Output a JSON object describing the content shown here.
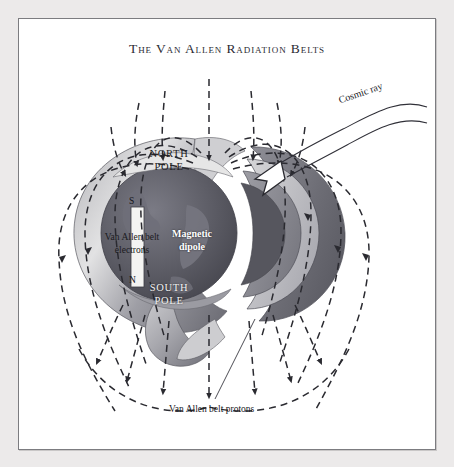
{
  "figure": {
    "title": "The Van Allen Radiation Belts",
    "type": "scientific-diagram"
  },
  "labels": {
    "north_pole_line1": "NORTH",
    "north_pole_line2": "POLE",
    "south_pole_line1": "SOUTH",
    "south_pole_line2": "POLE",
    "electrons_line1": "Van Allen belt",
    "electrons_line2": "electrons",
    "dipole_line1": "Magnetic",
    "dipole_line2": "dipole",
    "dipole_south": "S",
    "dipole_north": "N",
    "protons": "Van Allen belt protons",
    "cosmic_ray": "Cosmic ray"
  },
  "colors": {
    "page_background": "#eceaea",
    "panel_background": "#ffffff",
    "frame_border": "#7c7c80",
    "title_text": "#2b2b33",
    "field_line": "#2a2a30",
    "globe_dark": "#55555d",
    "globe_mid": "#6f6f78",
    "belt_light": "#d8d8da",
    "belt_mid": "#9a9aa0",
    "belt_dark": "#68686f",
    "dipole_bar": "#f4f4f2"
  }
}
